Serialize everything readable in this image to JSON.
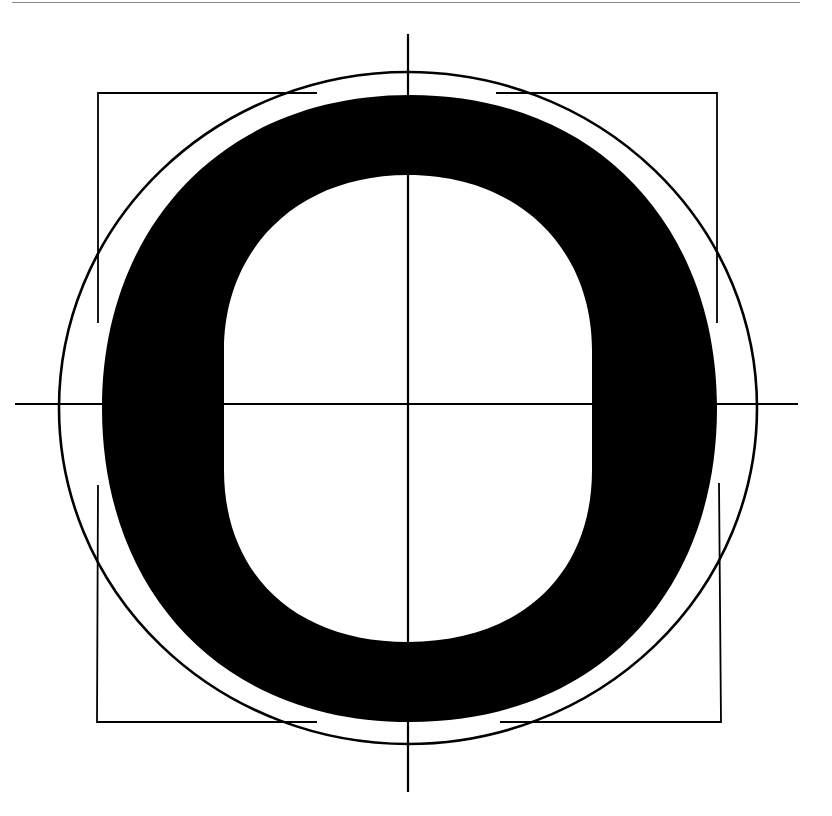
{
  "figure": {
    "glyph": "O",
    "colors": {
      "ink": "#000000",
      "paper": "#ffffff",
      "rule": "#8a8a8a"
    },
    "elements": {
      "top_rule": {
        "x1": 12,
        "x2": 800,
        "y": 2
      },
      "horizontal_axis": {
        "x1": 15,
        "x2": 798,
        "y": 404
      },
      "vertical_axis": {
        "x": 408,
        "y1": 34,
        "y2": 792
      },
      "guide_circle": {
        "cx": 408,
        "cy": 408,
        "rx": 349,
        "ry": 336
      },
      "outer_contour": {
        "left": 102,
        "right": 717,
        "top": 95,
        "bottom": 722
      },
      "inner_counter": {
        "left": 224,
        "right": 592,
        "top": 175,
        "bottom": 642
      },
      "corner_brackets": [
        {
          "corner": "top-left",
          "x": 98,
          "y": 93,
          "h_end": 317,
          "v_end": 323
        },
        {
          "corner": "top-right",
          "x": 717,
          "y": 93,
          "h_end": 496,
          "v_end": 323
        },
        {
          "corner": "bottom-left",
          "x": 97,
          "y": 722,
          "h_end": 317,
          "v_end": 485
        },
        {
          "corner": "bottom-right",
          "x": 721,
          "y": 722,
          "h_end": 500,
          "v_end": 483
        }
      ]
    }
  }
}
